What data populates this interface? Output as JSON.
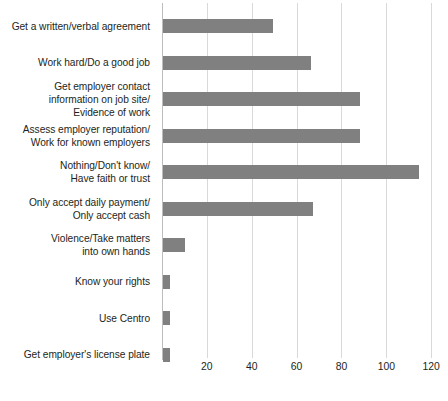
{
  "chart_data": {
    "type": "bar",
    "orientation": "horizontal",
    "title": "",
    "subtitle": "",
    "xlabel": "",
    "ylabel": "",
    "xlim": [
      0,
      128
    ],
    "ylim": null,
    "grid": true,
    "legend": null,
    "bar_color": "#808080",
    "gridline_color": "#d9d9d9",
    "axis_color": "#bdbdbd",
    "xticks": [
      20,
      40,
      60,
      80,
      100,
      120
    ],
    "xtick_labels": [
      "20",
      "40",
      "60",
      "80",
      "100",
      "120"
    ],
    "categories": [
      "Get a written/verbal agreement",
      "Work hard/Do a good job",
      "Get employer contact\ninformation on job site/\nEvidence of work",
      "Assess employer reputation/\nWork for known employers",
      "Nothing/Don't know/\nHave faith or trust",
      "Only accept daily payment/\nOnly accept cash",
      "Violence/Take matters\ninto own hands",
      "Know your rights",
      "Use Centro",
      "Get employer's license plate"
    ],
    "values": [
      49,
      66,
      88,
      88,
      114,
      67,
      10,
      3,
      3,
      3
    ]
  }
}
